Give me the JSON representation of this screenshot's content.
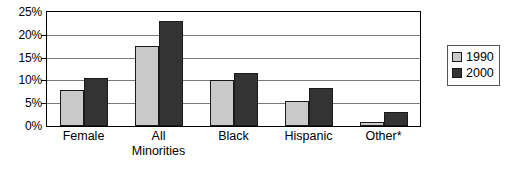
{
  "chart_data": {
    "type": "bar",
    "title": "",
    "subtitle": "",
    "xlabel": "",
    "ylabel": "",
    "categories": [
      "Female",
      "All Minorities",
      "Black",
      "Hispanic",
      "Other*"
    ],
    "category_lines": [
      [
        "Female"
      ],
      [
        "All",
        "Minorities"
      ],
      [
        "Black"
      ],
      [
        "Hispanic"
      ],
      [
        "Other*"
      ]
    ],
    "series": [
      {
        "name": "1990",
        "color": "#c9c9c9",
        "values": [
          8,
          17.5,
          10,
          5.5,
          0.8
        ]
      },
      {
        "name": "2000",
        "color": "#333333",
        "values": [
          10.6,
          23,
          11.7,
          8.3,
          3
        ]
      }
    ],
    "ylim": [
      0,
      25
    ],
    "ytick_values": [
      0,
      5,
      10,
      15,
      20,
      25
    ],
    "ytick_labels": [
      "0%",
      "5%",
      "10%",
      "15%",
      "20%",
      "25%"
    ],
    "grid": true,
    "grid_axis": "y",
    "legend": {
      "position": "right",
      "entries": [
        {
          "label": "1990",
          "color": "#c9c9c9"
        },
        {
          "label": "2000",
          "color": "#333333"
        }
      ]
    },
    "annotations": [
      "* asterisk on 'Other' category denotes footnote"
    ],
    "axis_line_color": "#000000",
    "gridline_color": "#7a7a7a",
    "background_color": "#ffffff"
  }
}
